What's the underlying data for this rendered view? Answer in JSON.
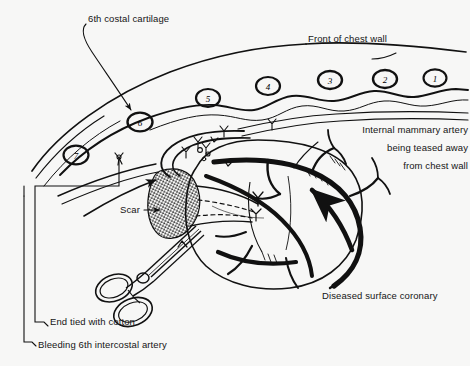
{
  "figure": {
    "background_color": "#f7f7f6",
    "ink_color": "#101010"
  },
  "labels": {
    "costal_cartilage": "6th costal cartilage",
    "chest_wall": "Front of chest wall",
    "mammary_line1": "Internal mammary artery",
    "mammary_line2": "being teased away",
    "mammary_line3": "from chest wall",
    "scar": "Scar",
    "coronary": "Diseased surface coronary",
    "cotton": "End tied with cotton",
    "bleeding": "Bleeding 6th intercostal artery"
  },
  "rib_numbers": [
    {
      "label": "1",
      "x": 435,
      "y": 78
    },
    {
      "label": "2",
      "x": 385,
      "y": 79
    },
    {
      "label": "3",
      "x": 330,
      "y": 80
    },
    {
      "label": "4",
      "x": 268,
      "y": 86
    },
    {
      "label": "5",
      "x": 208,
      "y": 98
    },
    {
      "label": "6",
      "x": 140,
      "y": 122
    },
    {
      "label": "7",
      "x": 76,
      "y": 155
    }
  ]
}
